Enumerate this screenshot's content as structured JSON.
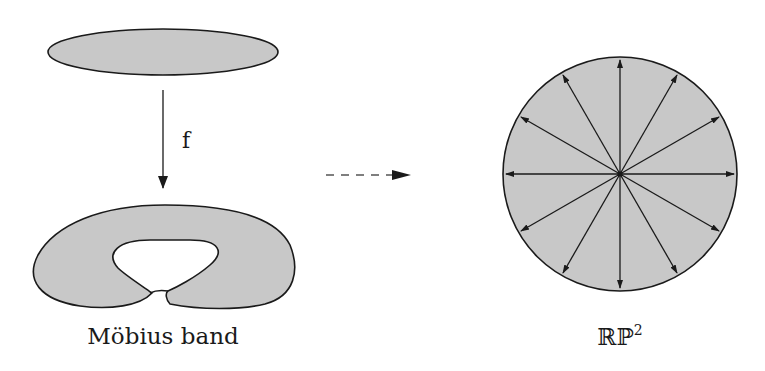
{
  "diagram": {
    "source": {
      "shape": "ellipse",
      "description": "flat disk seen edge-on"
    },
    "map": {
      "label": "f",
      "direction": "down"
    },
    "left_target": {
      "shape": "mobius-band",
      "label": "Möbius band"
    },
    "dashed_arrow": {
      "style": "dashed",
      "direction": "right"
    },
    "right_target": {
      "shape": "disk-with-antipodal-arrows",
      "arrow_count": 12,
      "label_main": "ℝℙ",
      "label_superscript": "2"
    },
    "colors": {
      "fill": "#c8c8c8",
      "stroke": "#1a1a1a",
      "background": "#ffffff"
    }
  }
}
